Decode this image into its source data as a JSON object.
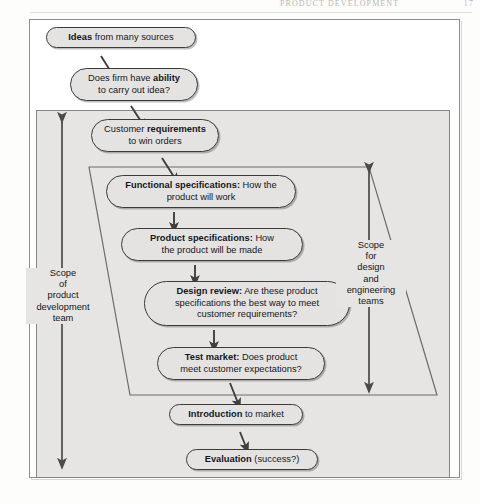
{
  "page": {
    "running_head": "PRODUCT DEVELOPMENT",
    "page_number": "17"
  },
  "diagram": {
    "nodes": [
      {
        "id": "ideas",
        "bold": "Ideas",
        "rest": " from many sources"
      },
      {
        "id": "ability",
        "bold": "Does firm have ability",
        "rest": "to carry out idea?",
        "line1_pre": "Does firm have ",
        "line1_bold": "ability",
        "line2": "to carry out idea?"
      },
      {
        "id": "requirements",
        "line1_pre": "Customer ",
        "line1_bold": "requirements",
        "line2": "to win orders"
      },
      {
        "id": "functional",
        "line1_bold": "Functional specifications:",
        "line1_post": " How the",
        "line2": "product will work"
      },
      {
        "id": "product",
        "line1_bold": "Product specifications:",
        "line1_post": " How",
        "line2": "the product will be made"
      },
      {
        "id": "design",
        "line1_bold": "Design review:",
        "line1_post": " Are these product",
        "line2": "specifications the best way to meet",
        "line3": "customer requirements?"
      },
      {
        "id": "test",
        "line1_bold": "Test market:",
        "line1_post": " Does product",
        "line2": "meet customer expectations?"
      },
      {
        "id": "introduction",
        "line1_bold": "Introduction",
        "line1_post": " to market"
      },
      {
        "id": "evaluation",
        "line1_bold": "Evaluation",
        "line1_post": " (success?)"
      }
    ],
    "scope_left_label": "Scope\nof\nproduct\ndevelopment\nteam",
    "scope_right_label": "Scope\nfor\ndesign\nand\nengineering\nteams"
  },
  "colors": {
    "node_fill": "#e4e3e1",
    "node_stroke": "#3b3b3b",
    "scope_fill": "#e6e5e3",
    "scope_stroke": "#8a8886",
    "arrow": "#3f3f3f",
    "page_bg": "#ffffff"
  }
}
